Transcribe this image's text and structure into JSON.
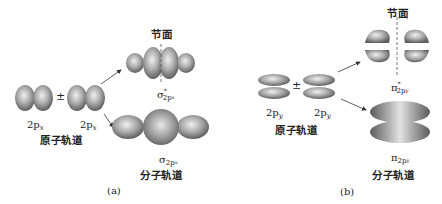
{
  "panel_a": {
    "caption": "(a)",
    "atomic": {
      "orbital1": {
        "main": "2p",
        "sub": "x"
      },
      "operator": "±",
      "orbital2": {
        "main": "2p",
        "sub": "x"
      },
      "group_label": "原子轨道"
    },
    "antibonding": {
      "node_label": "节面",
      "symbol": "σ",
      "star": "*",
      "sub_main": "2p",
      "sub_sub": "x"
    },
    "bonding": {
      "symbol": "σ",
      "sub_main": "2p",
      "sub_sub": "x",
      "group_label": "分子轨道"
    }
  },
  "panel_b": {
    "caption": "(b)",
    "atomic": {
      "orbital1": {
        "main": "2p",
        "sub": "y"
      },
      "operator": "±",
      "orbital2": {
        "main": "2p",
        "sub": "y"
      },
      "group_label": "原子轨道"
    },
    "antibonding": {
      "node_label": "节面",
      "symbol": "π",
      "star": "*",
      "sub_main": "2p",
      "sub_sub": "y"
    },
    "bonding": {
      "symbol": "π",
      "sub_main": "2p",
      "sub_sub": "y",
      "group_label": "分子轨道"
    }
  },
  "colors": {
    "lobe_light": "#e6e6e6",
    "lobe_dark": "#6a6a6a",
    "line": "#333333"
  }
}
